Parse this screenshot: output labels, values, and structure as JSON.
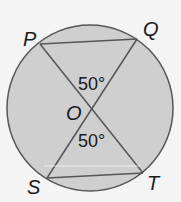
{
  "diagram": {
    "circle": {
      "cx": 90,
      "cy": 108,
      "r": 83,
      "fill": "#cfcfcf",
      "stroke": "#555555"
    },
    "points": {
      "P": {
        "label": "P",
        "x": 40,
        "y": 44
      },
      "Q": {
        "label": "Q",
        "x": 137,
        "y": 39
      },
      "S": {
        "label": "S",
        "x": 47,
        "y": 178
      },
      "T": {
        "label": "T",
        "x": 143,
        "y": 173
      },
      "O": {
        "label": "O",
        "x": 91,
        "y": 107
      }
    },
    "segments": [
      "PQ",
      "PT",
      "QS",
      "ST"
    ],
    "angles": [
      {
        "label": "50°",
        "at": "POQ"
      },
      {
        "label": "50°",
        "at": "SOT"
      }
    ]
  }
}
